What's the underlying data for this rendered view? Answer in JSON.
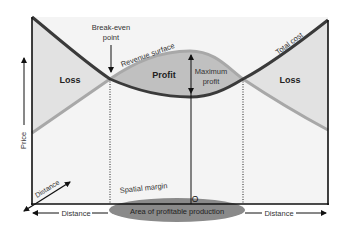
{
  "diagram": {
    "labels": {
      "break_even": [
        "Break-even",
        "point"
      ],
      "revenue_surface": "Revenue surface",
      "total_cost": "Total cost",
      "loss_left": "Loss",
      "loss_right": "Loss",
      "profit": "Profit",
      "maximum_profit": [
        "Maximum",
        "profit"
      ],
      "price_axis": "Price",
      "distance_diagonal": "Distance",
      "distance_left": "Distance",
      "distance_right": "Distance",
      "spatial_margin": "Spatial margin",
      "area_profitable": "Area of profitable production",
      "optimum_point": "O"
    },
    "colors": {
      "total_cost_line": "#3a3a3a",
      "revenue_line": "#a8a8a8",
      "loss_fill": "#e4e4e4",
      "profit_fill": "#c2c2c2",
      "ellipse_fill": "#8a8a8a",
      "background_panel": "#f4f4f4",
      "axis": "#111111"
    }
  }
}
